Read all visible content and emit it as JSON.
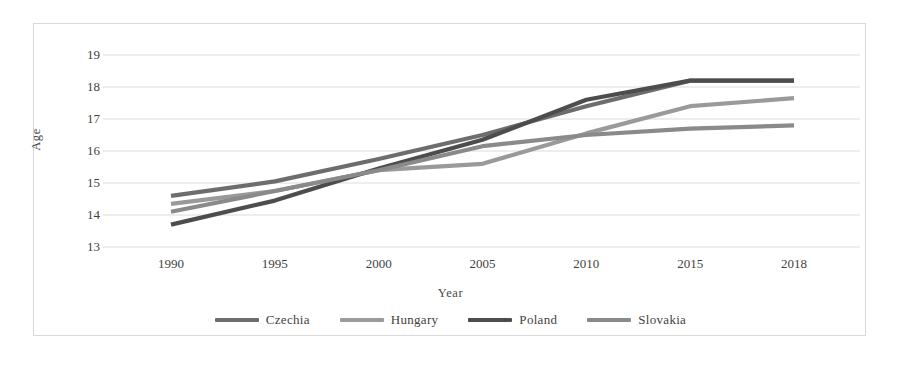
{
  "chart_data": {
    "type": "line",
    "title": "",
    "xlabel": "Year",
    "ylabel": "Age",
    "x": [
      1990,
      1995,
      2000,
      2005,
      2010,
      2015,
      2018
    ],
    "categories": [
      "1990",
      "1995",
      "2000",
      "2005",
      "2010",
      "2015",
      "2018"
    ],
    "xtick_labels": [
      "1990",
      "1995",
      "2000",
      "2005",
      "2010",
      "2015",
      "2018"
    ],
    "ytick_labels": [
      "13",
      "14",
      "15",
      "16",
      "17",
      "18",
      "19"
    ],
    "yticks": [
      13,
      14,
      15,
      16,
      17,
      18,
      19
    ],
    "ylim": [
      13,
      19
    ],
    "grid": "horizontal",
    "legend_position": "bottom",
    "series": [
      {
        "name": "Czechia",
        "color": "#6d6d6d",
        "values": [
          14.6,
          15.05,
          15.75,
          16.5,
          17.4,
          18.2,
          18.2
        ]
      },
      {
        "name": "Hungary",
        "color": "#9a9a9a",
        "values": [
          14.35,
          14.75,
          15.4,
          15.6,
          16.55,
          17.4,
          17.65
        ]
      },
      {
        "name": "Poland",
        "color": "#4d4d4d",
        "values": [
          13.7,
          14.45,
          15.45,
          16.35,
          17.6,
          18.2,
          18.2
        ]
      },
      {
        "name": "Slovakia",
        "color": "#8a8a8a",
        "values": [
          14.1,
          14.75,
          15.4,
          16.15,
          16.5,
          16.7,
          16.8
        ]
      }
    ]
  },
  "legend": {
    "entries": [
      {
        "label": "Czechia"
      },
      {
        "label": "Hungary"
      },
      {
        "label": "Poland"
      },
      {
        "label": "Slovakia"
      }
    ]
  },
  "style": {
    "border_color": "#d9d9d9",
    "grid_color": "#dcdcdc",
    "text_color": "#3f3f3f",
    "background": "#ffffff"
  }
}
